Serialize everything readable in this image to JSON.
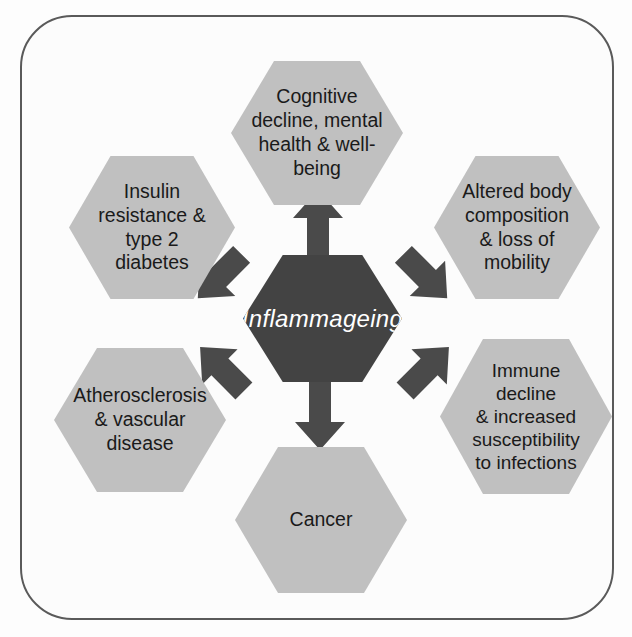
{
  "diagram": {
    "center": {
      "id": "inflammageing",
      "label": "Inflammageing",
      "fill": "#434343",
      "text_color": "#ffffff"
    },
    "spoke_fill": "#c0c0c0",
    "spoke_text_color": "#1a1a1a",
    "frame_border_color": "#5a5a5a",
    "background": "#fcfcfc",
    "arrow_color": "#4a4a4a",
    "nodes": [
      {
        "id": "cognitive",
        "label": "Cognitive\ndecline, mental\nhealth & well-\nbeing",
        "position": "top",
        "arrow": "up"
      },
      {
        "id": "insulin",
        "label": "Insulin\nresistance &\ntype 2\ndiabetes",
        "position": "top-left",
        "arrow": "up-left"
      },
      {
        "id": "body-composition",
        "label": "Altered body\ncomposition\n& loss of\nmobility",
        "position": "top-right",
        "arrow": "up-right"
      },
      {
        "id": "atherosclerosis",
        "label": "Atherosclerosis\n& vascular\ndisease",
        "position": "bottom-left",
        "arrow": "down-left"
      },
      {
        "id": "immune",
        "label": "Immune\ndecline\n& increased\nsusceptibility\nto infections",
        "position": "bottom-right",
        "arrow": "down-right"
      },
      {
        "id": "cancer",
        "label": "Cancer",
        "position": "bottom",
        "arrow": "down"
      }
    ]
  }
}
